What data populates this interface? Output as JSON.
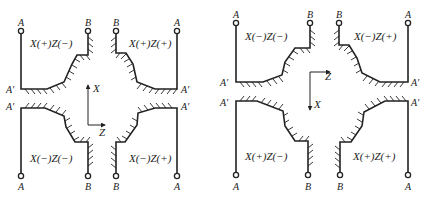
{
  "diagram": {
    "colors": {
      "stroke": "#222222",
      "background": "#ffffff"
    },
    "left": {
      "axes": {
        "x_label": "X",
        "z_label": "Z",
        "x_direction": "up",
        "z_direction": "right"
      },
      "quadrants": {
        "top_left": {
          "label": "X(+)Z(−)",
          "start": "A",
          "corner": "A′",
          "end": "B"
        },
        "top_right": {
          "label": "X(+)Z(+)",
          "start": "A",
          "corner": "A′",
          "end": "B"
        },
        "bottom_left": {
          "label": "X(−)Z(−)",
          "start": "A",
          "corner": "A′",
          "end": "B"
        },
        "bottom_right": {
          "label": "X(−)Z(+)",
          "start": "A",
          "corner": "A′",
          "end": "B"
        }
      }
    },
    "right": {
      "axes": {
        "x_label": "X",
        "z_label": "Z",
        "x_direction": "down",
        "z_direction": "right"
      },
      "quadrants": {
        "top_left": {
          "label": "X(−)Z(−)",
          "start": "A",
          "corner": "A′",
          "end": "B"
        },
        "top_right": {
          "label": "X(−)Z(+)",
          "start": "A",
          "corner": "A′",
          "end": "B"
        },
        "bottom_left": {
          "label": "X(+)Z(−)",
          "start": "A",
          "corner": "A′",
          "end": "B"
        },
        "bottom_right": {
          "label": "X(+)Z(+)",
          "start": "A",
          "corner": "A′",
          "end": "B"
        }
      }
    }
  }
}
